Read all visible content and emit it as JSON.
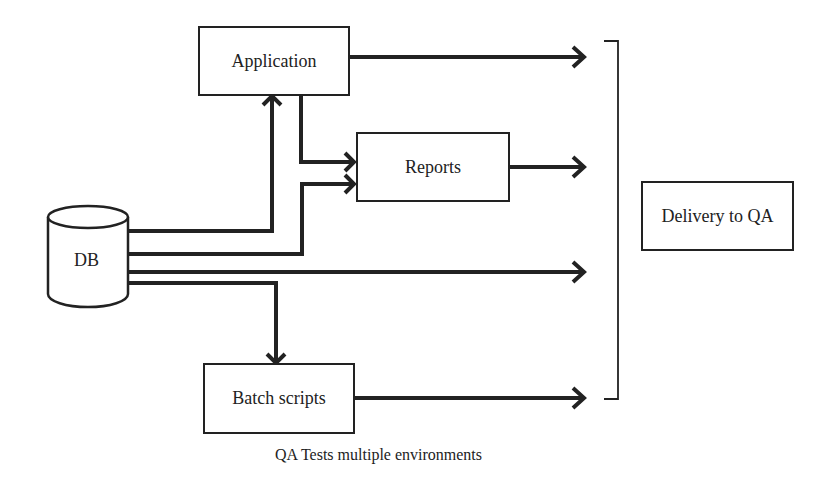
{
  "diagram": {
    "nodes": {
      "application": {
        "label": "Application"
      },
      "reports": {
        "label": "Reports"
      },
      "db": {
        "label": "DB"
      },
      "batch_scripts": {
        "label": "Batch scripts"
      },
      "delivery": {
        "label": "Delivery to QA"
      }
    },
    "edges": [
      {
        "from": "DB",
        "to": "Application"
      },
      {
        "from": "Application",
        "to": "Reports"
      },
      {
        "from": "DB",
        "to": "Reports"
      },
      {
        "from": "DB",
        "to": "Batch scripts"
      },
      {
        "from": "Application",
        "to": "Delivery to QA"
      },
      {
        "from": "Reports",
        "to": "Delivery to QA"
      },
      {
        "from": "DB",
        "to": "Delivery to QA"
      },
      {
        "from": "Batch scripts",
        "to": "Delivery to QA"
      }
    ],
    "caption": "QA Tests multiple environments",
    "stroke_color": "#222222"
  }
}
